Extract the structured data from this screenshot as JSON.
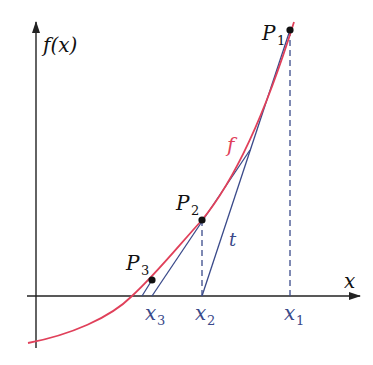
{
  "diagram": {
    "colors": {
      "axis": "#222222",
      "curve": "#e0405a",
      "tangent": "#3a4a8a",
      "dashed": "#3a4a8a",
      "label_blue": "#3a4a8a",
      "label_black": "#111111",
      "curve_label": "#e0405a"
    },
    "axes": {
      "y_label": "f(x)",
      "x_label": "x"
    },
    "curve_label": "f",
    "tangent_label": "t",
    "points": [
      {
        "name": "P",
        "sub": "1"
      },
      {
        "name": "P",
        "sub": "2"
      },
      {
        "name": "P",
        "sub": "3"
      }
    ],
    "x_ticks": [
      {
        "name": "x",
        "sub": "3"
      },
      {
        "name": "x",
        "sub": "2"
      },
      {
        "name": "x",
        "sub": "1"
      }
    ]
  }
}
